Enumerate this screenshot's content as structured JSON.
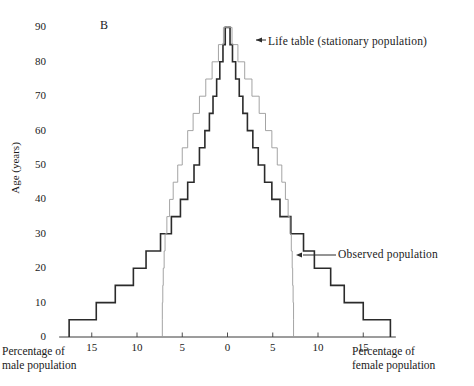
{
  "panel": {
    "label": "B"
  },
  "axes": {
    "y_title": "Age (years)",
    "y_ticks": [
      0,
      10,
      20,
      30,
      40,
      50,
      60,
      70,
      80,
      90
    ],
    "x_ticks_left": [
      15,
      10,
      5
    ],
    "x_ticks_center": 0,
    "x_ticks_right": [
      5,
      10,
      15
    ],
    "male_caption_line1": "Percentage of",
    "male_caption_line2": "male population",
    "female_caption_line1": "Percentage of",
    "female_caption_line2": "female population"
  },
  "annotations": {
    "life_table": "Life table (stationary population)",
    "observed": "Observed population"
  },
  "colors": {
    "observed": "#2b2b2b",
    "life_table": "#9a9a9a",
    "axis": "#3a3a3a",
    "background": "#ffffff"
  },
  "chart_data": {
    "type": "area",
    "title": "",
    "subtitle": "",
    "xlabel": "Percentage of population",
    "ylabel": "Age (years)",
    "xlim": [
      -18.5,
      18.5
    ],
    "ylim": [
      0,
      90
    ],
    "grid": false,
    "legend_position": "annotation-callouts",
    "age_groups": [
      "0-5",
      "5-10",
      "10-15",
      "15-20",
      "20-25",
      "25-30",
      "30-35",
      "35-40",
      "40-45",
      "45-50",
      "50-55",
      "55-60",
      "60-65",
      "65-70",
      "70-75",
      "75-80",
      "80-85",
      "85-90"
    ],
    "age_lower": [
      0,
      5,
      10,
      15,
      20,
      25,
      30,
      35,
      40,
      45,
      50,
      55,
      60,
      65,
      70,
      75,
      80,
      85
    ],
    "series": [
      {
        "name": "Observed population",
        "side": "male",
        "color": "#2b2b2b",
        "values": [
          17.5,
          14.5,
          12.4,
          10.4,
          9.0,
          7.4,
          6.2,
          5.2,
          4.4,
          3.7,
          3.1,
          2.5,
          2.0,
          1.6,
          1.2,
          0.85,
          0.5,
          0.25
        ]
      },
      {
        "name": "Observed population",
        "side": "female",
        "color": "#2b2b2b",
        "values": [
          18.0,
          15.0,
          12.9,
          11.4,
          9.6,
          8.4,
          7.0,
          5.8,
          4.9,
          4.1,
          3.4,
          2.8,
          2.2,
          1.7,
          1.3,
          0.9,
          0.55,
          0.28
        ]
      },
      {
        "name": "Life table (stationary population)",
        "side": "male",
        "color": "#9a9a9a",
        "values": [
          7.2,
          7.2,
          7.15,
          7.1,
          7.0,
          6.9,
          6.7,
          6.4,
          6.0,
          5.5,
          5.0,
          4.4,
          3.8,
          3.1,
          2.4,
          1.7,
          1.0,
          0.45
        ]
      },
      {
        "name": "Life table (stationary population)",
        "side": "female",
        "color": "#9a9a9a",
        "values": [
          7.3,
          7.3,
          7.25,
          7.2,
          7.15,
          7.05,
          6.9,
          6.7,
          6.4,
          6.0,
          5.5,
          4.9,
          4.2,
          3.5,
          2.7,
          1.9,
          1.15,
          0.5
        ]
      }
    ]
  }
}
